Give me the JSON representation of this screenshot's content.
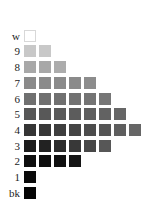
{
  "chart_data": {
    "type": "heatmap",
    "title": "",
    "rows": [
      {
        "label": "w",
        "count": 1,
        "colors": [
          "#ffffff"
        ]
      },
      {
        "label": "9",
        "count": 2,
        "colors": [
          "#c8c8c8",
          "#c8c8c8"
        ]
      },
      {
        "label": "8",
        "count": 3,
        "colors": [
          "#a8a8a8",
          "#a8a8a8",
          "#acacac"
        ]
      },
      {
        "label": "7",
        "count": 5,
        "colors": [
          "#8a8a8a",
          "#8a8a8a",
          "#8a8a8a",
          "#8a8a8a",
          "#8c8c8c"
        ]
      },
      {
        "label": "6",
        "count": 6,
        "colors": [
          "#707070",
          "#707070",
          "#707070",
          "#727272",
          "#747474",
          "#767676"
        ]
      },
      {
        "label": "5",
        "count": 7,
        "colors": [
          "#575757",
          "#585858",
          "#5a5a5a",
          "#5c5c5c",
          "#5e5e5e",
          "#626262",
          "#666666"
        ]
      },
      {
        "label": "4",
        "count": 8,
        "colors": [
          "#353535",
          "#383838",
          "#3e3e3e",
          "#454545",
          "#4c4c4c",
          "#555555",
          "#5e5e5e",
          "#666666"
        ]
      },
      {
        "label": "3",
        "count": 6,
        "colors": [
          "#1c1c1c",
          "#222222",
          "#2c2c2c",
          "#383838",
          "#474747",
          "#575757"
        ]
      },
      {
        "label": "2",
        "count": 4,
        "colors": [
          "#0e0e0e",
          "#0e0e0e",
          "#101010",
          "#151515"
        ]
      },
      {
        "label": "1",
        "count": 1,
        "colors": [
          "#0a0a0a"
        ]
      },
      {
        "label": "bk",
        "count": 1,
        "colors": [
          "#050505"
        ]
      }
    ],
    "layout": {
      "swatch_size": 12,
      "col_step": 15,
      "first_col_x": 24,
      "row_tops": [
        29,
        44,
        60,
        76,
        92,
        107,
        123,
        139,
        154,
        170,
        186
      ]
    }
  }
}
